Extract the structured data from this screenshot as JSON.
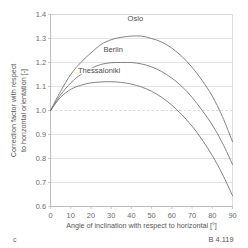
{
  "panel_letter": "c",
  "caption": "B 4.119",
  "chart_data": {
    "type": "line",
    "title": "",
    "xlabel": "Angle of inclination with respect to horizontal [°]",
    "ylabel_line1": "Correction factor with respect",
    "ylabel_line2": "to horizontal orientation [-]",
    "xlim": [
      0,
      90
    ],
    "ylim": [
      0.6,
      1.4
    ],
    "xticks": [
      0,
      10,
      20,
      30,
      40,
      50,
      60,
      70,
      80,
      90
    ],
    "xtick_labels": [
      "0",
      "10",
      "20",
      "30",
      "40",
      "50",
      "60",
      "70",
      "80",
      "90"
    ],
    "yticks": [
      0.6,
      0.7,
      0.8,
      0.9,
      1.0,
      1.1,
      1.2,
      1.3,
      1.4
    ],
    "ytick_labels": [
      "0.6",
      "0.7",
      "0.8",
      "0.9",
      "1.0",
      "1.1",
      "1.2",
      "1.3",
      "1.4"
    ],
    "grid": true,
    "reference_line": 1.0,
    "legend_position": "inline-labels",
    "x": [
      0,
      5,
      10,
      15,
      20,
      25,
      30,
      35,
      40,
      45,
      50,
      55,
      60,
      65,
      70,
      75,
      80,
      85,
      90
    ],
    "series": [
      {
        "name": "Oslo",
        "label_x": 42,
        "label_y": 1.375,
        "peak_x": 45,
        "peak_y": 1.31,
        "values": [
          1.0,
          1.08,
          1.15,
          1.2,
          1.24,
          1.275,
          1.295,
          1.305,
          1.31,
          1.31,
          1.3,
          1.285,
          1.26,
          1.225,
          1.18,
          1.125,
          1.06,
          0.975,
          0.87
        ]
      },
      {
        "name": "Berlin",
        "label_x": 31,
        "label_y": 1.245,
        "peak_x": 38,
        "peak_y": 1.2,
        "values": [
          1.0,
          1.065,
          1.115,
          1.15,
          1.175,
          1.192,
          1.199,
          1.2,
          1.2,
          1.194,
          1.182,
          1.162,
          1.135,
          1.1,
          1.055,
          1.0,
          0.94,
          0.865,
          0.775
        ]
      },
      {
        "name": "Thessaloniki",
        "label_x": 24,
        "label_y": 1.155,
        "peak_x": 30,
        "peak_y": 1.12,
        "values": [
          1.0,
          1.055,
          1.088,
          1.105,
          1.115,
          1.119,
          1.12,
          1.117,
          1.11,
          1.098,
          1.08,
          1.055,
          1.022,
          0.982,
          0.935,
          0.878,
          0.812,
          0.735,
          0.645
        ]
      }
    ]
  },
  "colors": {
    "curve": "#6e6e6e",
    "grid": "#d2d2d2",
    "axis": "#b5b5b5",
    "text": "#555555",
    "background": "#ffffff"
  }
}
